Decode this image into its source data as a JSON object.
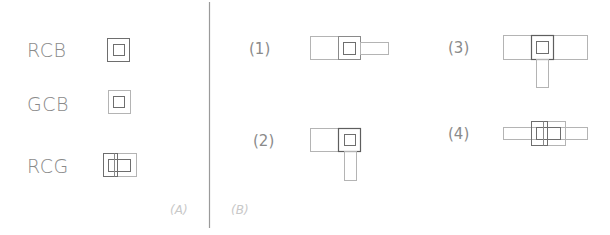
{
  "panel_a": {
    "caption": "(A)",
    "items": [
      {
        "label": "RCB"
      },
      {
        "label": "GCB"
      },
      {
        "label": "RCG"
      }
    ]
  },
  "panel_b": {
    "caption": "(B)",
    "items": [
      {
        "label": "(1)"
      },
      {
        "label": "(2)"
      },
      {
        "label": "(3)"
      },
      {
        "label": "(4)"
      }
    ]
  },
  "colors": {
    "background": "#ffffff",
    "dark_stroke": "#6e6e6e",
    "light_stroke": "#b4b4b4",
    "text": "#8a8a8a",
    "caption": "#c8c8c8",
    "divider": "#9a9a9a"
  }
}
